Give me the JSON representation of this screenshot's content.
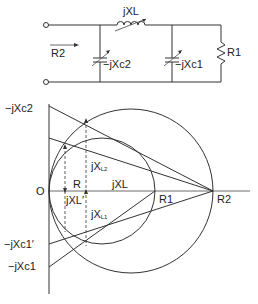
{
  "circuit": {
    "inductor_label": "jXL",
    "input_label": "R2",
    "cap2_label": "−jXc2",
    "cap1_label": "−jXc1",
    "resistor_label": "R1"
  },
  "chart": {
    "axis_labels": {
      "origin": "O",
      "top": "−jXc2",
      "c1_prime": "−jXc1′",
      "c1": "−jXc1"
    },
    "inner_labels": {
      "R": "R",
      "jXL": "jXL",
      "jXL2_main": "jX",
      "jXL2_sub": "L2",
      "jXL1_main": "jX",
      "jXL1_sub": "L1",
      "jXL_prime": "jXL′",
      "R1": "R1",
      "R2": "R2"
    }
  }
}
